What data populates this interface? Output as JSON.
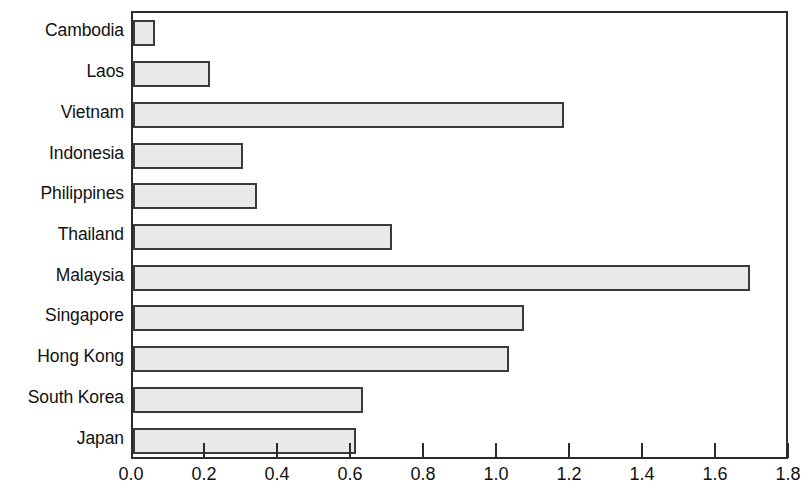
{
  "chart_data": {
    "type": "bar",
    "orientation": "horizontal",
    "title": "",
    "subtitle": "",
    "xlabel": "",
    "ylabel": "",
    "categories": [
      "Cambodia",
      "Laos",
      "Vietnam",
      "Indonesia",
      "Philippines",
      "Thailand",
      "Malaysia",
      "Singapore",
      "Hong Kong",
      "South Korea",
      "Japan"
    ],
    "values": [
      0.06,
      0.21,
      1.18,
      0.3,
      0.34,
      0.71,
      1.69,
      1.07,
      1.03,
      0.63,
      0.61
    ],
    "xlim": [
      0.0,
      1.8
    ],
    "xticks": [
      0.0,
      0.2,
      0.4,
      0.6,
      0.8,
      1.0,
      1.2,
      1.4,
      1.6,
      1.8
    ],
    "xtick_labels": [
      "0.0",
      "0.2",
      "0.4",
      "0.6",
      "0.8",
      "1.0",
      "1.2",
      "1.4",
      "1.6",
      "1.8"
    ],
    "grid": false,
    "legend": null,
    "legend_position": "none",
    "bar_fill_color": "#e9e9e9",
    "bar_border_color": "#3a3a3a",
    "axis_color": "#2b2b2b",
    "background_color": "#ffffff",
    "annotations": []
  }
}
